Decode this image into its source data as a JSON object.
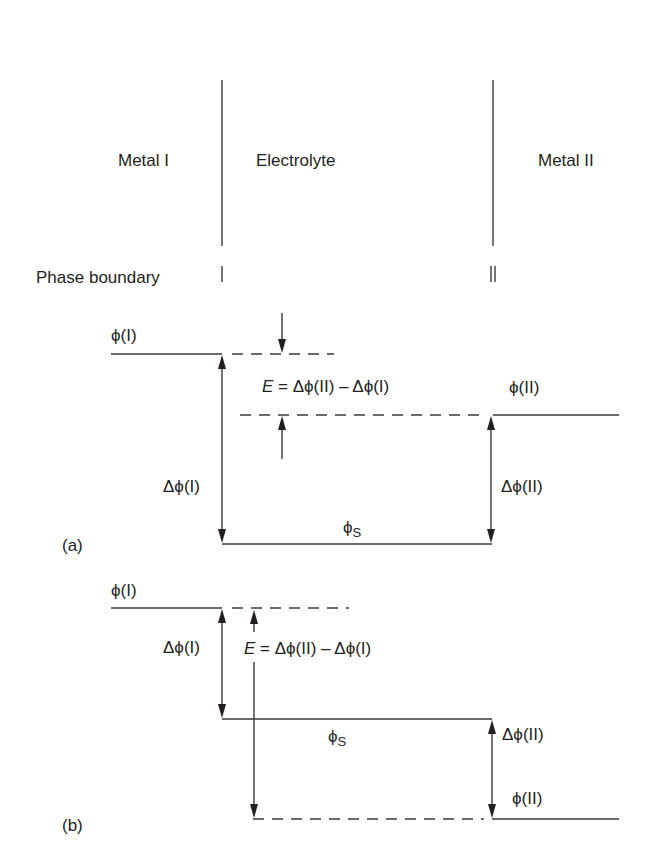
{
  "diagram": {
    "regions": [
      "Metal I",
      "Electrolyte",
      "Metal II"
    ],
    "phase_boundary_label": "Phase boundary",
    "boundary_markers": [
      "I",
      "II"
    ],
    "panel_a": {
      "tag": "(a)",
      "phi_I": "ϕ(I)",
      "phi_II": "ϕ(II)",
      "delta_phi_I": "Δϕ(I)",
      "delta_phi_II": "Δϕ(II)",
      "phi_S": "ϕ",
      "phi_S_sub": "S",
      "emf_E": "E",
      "emf_rhs": " = Δϕ(II) – Δϕ(I)"
    },
    "panel_b": {
      "tag": "(b)",
      "phi_I": "ϕ(I)",
      "phi_II": "ϕ(II)",
      "delta_phi_I": "Δϕ(I)",
      "delta_phi_II": "Δϕ(II)",
      "phi_S": "ϕ",
      "phi_S_sub": "S",
      "emf_E": "E",
      "emf_rhs": " = Δϕ(II) – Δϕ(I)"
    }
  }
}
